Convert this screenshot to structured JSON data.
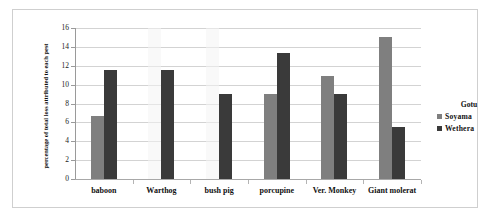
{
  "chart_data": {
    "type": "bar",
    "title": "",
    "xlabel": "",
    "ylabel": "percentage of total loss attributed to each pest",
    "ylim": [
      0,
      16
    ],
    "ytick_step": 2,
    "yticks": [
      "0",
      "2",
      "4",
      "6",
      "8",
      "10",
      "12",
      "14",
      "16"
    ],
    "grid": true,
    "legend_position": "right",
    "legend_title": "Gotu",
    "categories": [
      "baboon",
      "Warthog",
      "bush pig",
      "porcupine",
      "Ver. Monkey",
      "Giant molerat"
    ],
    "series": [
      {
        "name": "Soyama",
        "color": "#7f7f7f",
        "values": [
          6.7,
          0,
          0,
          9.0,
          10.9,
          15.0
        ]
      },
      {
        "name": "Wethera",
        "color": "#3a3a3a",
        "values": [
          11.6,
          11.6,
          9.0,
          13.3,
          9.0,
          5.5
        ]
      }
    ]
  },
  "axis": {
    "y_title": "percentage of total loss attributed to each pest"
  },
  "legend": {
    "title": "Gotu",
    "items": [
      {
        "label": "Soyama",
        "color": "#7f7f7f"
      },
      {
        "label": "Wethera",
        "color": "#3a3a3a"
      }
    ]
  },
  "colors": {
    "soyama": "#7f7f7f",
    "wethera": "#3a3a3a",
    "gridline": "#d3d3d3",
    "frame_border": "#cfcfcf",
    "background": "#ffffff"
  }
}
